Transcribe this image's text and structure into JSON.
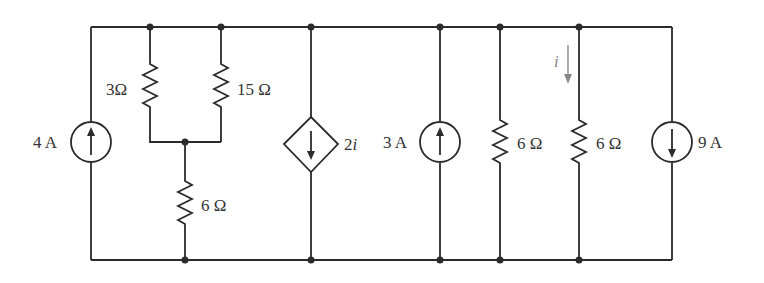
{
  "circuit": {
    "components": [
      {
        "id": "src_4A",
        "type": "current-source",
        "label": "4 A",
        "direction": "up"
      },
      {
        "id": "r_3",
        "type": "resistor",
        "label": "3Ω"
      },
      {
        "id": "r_15",
        "type": "resistor",
        "label": "15 Ω"
      },
      {
        "id": "r_6a",
        "type": "resistor",
        "label": "6 Ω"
      },
      {
        "id": "dep_2i",
        "type": "dependent-current-source",
        "label": "2i",
        "direction": "down"
      },
      {
        "id": "src_3A",
        "type": "current-source",
        "label": "3 A",
        "direction": "up"
      },
      {
        "id": "r_6b",
        "type": "resistor",
        "label": "6 Ω"
      },
      {
        "id": "r_6c",
        "type": "resistor",
        "label": "6 Ω",
        "current_label": "i",
        "current_direction": "down"
      },
      {
        "id": "src_9A",
        "type": "current-source",
        "label": "9 A",
        "direction": "down"
      }
    ],
    "labels": {
      "src_4A": "4 A",
      "r_3": "3Ω",
      "r_15": "15 Ω",
      "r_6a": "6 Ω",
      "dep_2i_num": "2",
      "dep_2i_var": "i",
      "src_3A": "3 A",
      "r_6b": "6 Ω",
      "r_6c": "6 Ω",
      "current_i": "i",
      "src_9A": "9 A"
    }
  }
}
